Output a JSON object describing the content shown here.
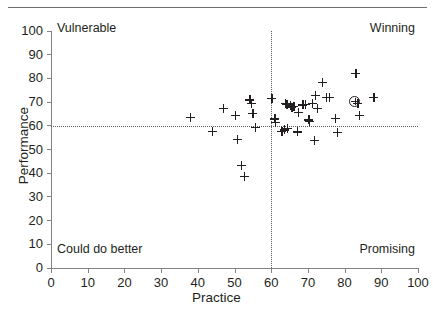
{
  "chart_data": {
    "type": "scatter",
    "title": "",
    "xlabel": "Practice",
    "ylabel": "Performance",
    "xlim": [
      0,
      100
    ],
    "ylim": [
      0,
      100
    ],
    "xticks": [
      0,
      10,
      20,
      30,
      40,
      50,
      60,
      70,
      80,
      90,
      100
    ],
    "yticks": [
      0,
      10,
      20,
      30,
      40,
      50,
      60,
      70,
      80,
      90,
      100
    ],
    "grid": false,
    "legend": null,
    "reference_lines": {
      "vertical_x": 60,
      "horizontal_y": 60,
      "style": "dotted"
    },
    "quadrant_annotations": [
      {
        "key": "top-left",
        "text": "Vulnerable"
      },
      {
        "key": "top-right",
        "text": "Winning"
      },
      {
        "key": "bottom-left",
        "text": "Could do better"
      },
      {
        "key": "bottom-right",
        "text": "Promising"
      }
    ],
    "marker": "plus",
    "points": [
      {
        "x": 38.0,
        "y": 63.5,
        "style": "plus"
      },
      {
        "x": 44.0,
        "y": 57.8,
        "style": "plus"
      },
      {
        "x": 47.0,
        "y": 67.5,
        "style": "plus"
      },
      {
        "x": 50.3,
        "y": 64.4,
        "style": "plus"
      },
      {
        "x": 50.8,
        "y": 54.4,
        "style": "plus"
      },
      {
        "x": 51.8,
        "y": 43.4,
        "style": "plus"
      },
      {
        "x": 52.6,
        "y": 38.6,
        "style": "plus"
      },
      {
        "x": 54.2,
        "y": 71.0,
        "style": "plus"
      },
      {
        "x": 54.6,
        "y": 69.4,
        "style": "plus"
      },
      {
        "x": 55.0,
        "y": 65.3,
        "style": "plus"
      },
      {
        "x": 55.7,
        "y": 59.4,
        "style": "plus"
      },
      {
        "x": 60.2,
        "y": 71.5,
        "style": "plus"
      },
      {
        "x": 61.0,
        "y": 62.9,
        "style": "plus"
      },
      {
        "x": 61.2,
        "y": 61.6,
        "style": "plus"
      },
      {
        "x": 62.9,
        "y": 57.7,
        "style": "plus"
      },
      {
        "x": 63.6,
        "y": 58.3,
        "style": "plus"
      },
      {
        "x": 63.8,
        "y": 69.4,
        "style": "plus"
      },
      {
        "x": 64.3,
        "y": 69.0,
        "style": "plus"
      },
      {
        "x": 64.4,
        "y": 59.0,
        "style": "plus"
      },
      {
        "x": 65.2,
        "y": 68.5,
        "style": "plus"
      },
      {
        "x": 65.6,
        "y": 67.8,
        "style": "plus"
      },
      {
        "x": 66.2,
        "y": 68.1,
        "style": "plus"
      },
      {
        "x": 67.1,
        "y": 57.5,
        "style": "plus"
      },
      {
        "x": 67.4,
        "y": 65.6,
        "style": "plus"
      },
      {
        "x": 68.6,
        "y": 68.8,
        "style": "plus"
      },
      {
        "x": 69.3,
        "y": 69.1,
        "style": "plus"
      },
      {
        "x": 70.2,
        "y": 62.5,
        "style": "plus"
      },
      {
        "x": 70.4,
        "y": 61.9,
        "style": "plus"
      },
      {
        "x": 71.2,
        "y": 69.4,
        "style": "plus"
      },
      {
        "x": 71.8,
        "y": 54.0,
        "style": "plus"
      },
      {
        "x": 72.0,
        "y": 72.8,
        "style": "plus"
      },
      {
        "x": 72.6,
        "y": 67.4,
        "style": "plus"
      },
      {
        "x": 74.0,
        "y": 78.4,
        "style": "plus"
      },
      {
        "x": 75.0,
        "y": 72.1,
        "style": "plus"
      },
      {
        "x": 75.8,
        "y": 72.1,
        "style": "plus"
      },
      {
        "x": 77.4,
        "y": 63.2,
        "style": "plus"
      },
      {
        "x": 78.0,
        "y": 57.3,
        "style": "plus"
      },
      {
        "x": 82.8,
        "y": 70.4,
        "style": "circled-plus"
      },
      {
        "x": 83.0,
        "y": 82.2,
        "style": "plus"
      },
      {
        "x": 83.6,
        "y": 69.5,
        "style": "plus"
      },
      {
        "x": 84.0,
        "y": 64.3,
        "style": "plus"
      },
      {
        "x": 88.0,
        "y": 72.0,
        "style": "plus"
      }
    ]
  }
}
